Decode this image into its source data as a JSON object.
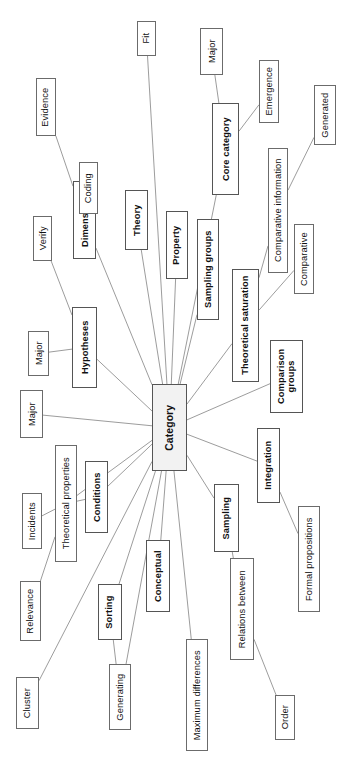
{
  "figure": {
    "type": "mind-map",
    "orientation_note": "figure printed sideways; all labels rotated 90 degrees",
    "center_label": "Category",
    "colors": {
      "page_background": "#ffffff",
      "box_fill": "#ffffff",
      "center_box_fill": "#f2f2f2",
      "box_stroke": "#6b6b6b",
      "edge_stroke": "#8a8a8a",
      "text": "#111111"
    }
  },
  "center": {
    "id": "category",
    "label": "Category",
    "bold": true,
    "x": 152,
    "y": 384,
    "w": 35,
    "h": 87
  },
  "nodes": [
    {
      "id": "dimensions",
      "label": "Dimensions",
      "level": 1,
      "x": 73,
      "y": 181,
      "w": 23,
      "h": 78,
      "lines": 1
    },
    {
      "id": "theory",
      "label": "Theory",
      "level": 1,
      "x": 125,
      "y": 190,
      "w": 23,
      "h": 60,
      "lines": 1
    },
    {
      "id": "property",
      "label": "Property",
      "level": 1,
      "x": 166,
      "y": 211,
      "w": 22,
      "h": 68,
      "lines": 1
    },
    {
      "id": "sampling-groups",
      "label": "Sampling groups",
      "level": 1,
      "x": 197,
      "y": 219,
      "w": 22,
      "h": 101,
      "lines": 1
    },
    {
      "id": "core-category",
      "label": "Core category",
      "level": 1,
      "x": 212,
      "y": 103,
      "w": 27,
      "h": 92,
      "lines": 1
    },
    {
      "id": "theoretical-saturation",
      "label": "Theoretical saturation",
      "level": 1,
      "x": 232,
      "y": 269,
      "w": 27,
      "h": 113,
      "lines": 1
    },
    {
      "id": "comparison-groups",
      "label": "Comparison groups",
      "level": 1,
      "x": 270,
      "y": 340,
      "w": 33,
      "h": 73,
      "lines": 2
    },
    {
      "id": "hypotheses",
      "label": "Hypotheses",
      "level": 1,
      "x": 72,
      "y": 307,
      "w": 25,
      "h": 81,
      "lines": 1
    },
    {
      "id": "conditions",
      "label": "Conditions",
      "level": 1,
      "x": 85,
      "y": 461,
      "w": 23,
      "h": 72,
      "lines": 1
    },
    {
      "id": "integration",
      "label": "Integration",
      "level": 1,
      "x": 257,
      "y": 428,
      "w": 23,
      "h": 75,
      "lines": 1
    },
    {
      "id": "sampling",
      "label": "Sampling",
      "level": 1,
      "x": 214,
      "y": 484,
      "w": 25,
      "h": 68,
      "lines": 1
    },
    {
      "id": "conceptual",
      "label": "Conceptual",
      "level": 1,
      "x": 146,
      "y": 540,
      "w": 24,
      "h": 72,
      "lines": 1
    },
    {
      "id": "sorting",
      "label": "Sorting",
      "level": 1,
      "x": 98,
      "y": 584,
      "w": 24,
      "h": 56,
      "lines": 1
    },
    {
      "id": "evidence",
      "label": "Evidence",
      "level": 2,
      "x": 36,
      "y": 78,
      "w": 20,
      "h": 58,
      "lines": 1
    },
    {
      "id": "coding",
      "label": "Coding",
      "level": 2,
      "x": 79,
      "y": 162,
      "w": 19,
      "h": 52,
      "lines": 1
    },
    {
      "id": "fit",
      "label": "Fit",
      "level": 2,
      "x": 137,
      "y": 21,
      "w": 19,
      "h": 35,
      "lines": 1
    },
    {
      "id": "major-core",
      "label": "Major",
      "level": 2,
      "x": 200,
      "y": 28,
      "w": 23,
      "h": 47,
      "lines": 1
    },
    {
      "id": "emergence",
      "label": "Emergence",
      "level": 2,
      "x": 259,
      "y": 60,
      "w": 20,
      "h": 63,
      "lines": 1
    },
    {
      "id": "generated",
      "label": "Generated",
      "level": 2,
      "x": 314,
      "y": 85,
      "w": 22,
      "h": 60,
      "lines": 1
    },
    {
      "id": "comparative-information",
      "label": "Comparative information",
      "level": 2,
      "x": 268,
      "y": 148,
      "w": 20,
      "h": 125,
      "lines": 1
    },
    {
      "id": "comparative",
      "label": "Comparative",
      "level": 2,
      "x": 294,
      "y": 224,
      "w": 20,
      "h": 70,
      "lines": 1
    },
    {
      "id": "verify",
      "label": "Verify",
      "level": 2,
      "x": 33,
      "y": 216,
      "w": 19,
      "h": 45,
      "lines": 1
    },
    {
      "id": "major-hypotheses",
      "label": "Major",
      "level": 2,
      "x": 28,
      "y": 331,
      "w": 21,
      "h": 45,
      "lines": 1
    },
    {
      "id": "major-category",
      "label": "Major",
      "level": 2,
      "x": 20,
      "y": 390,
      "w": 23,
      "h": 48,
      "lines": 1
    },
    {
      "id": "theoretical-properties",
      "label": "Theoretical properties",
      "level": 2,
      "x": 55,
      "y": 445,
      "w": 22,
      "h": 117,
      "lines": 1
    },
    {
      "id": "incidents",
      "label": "Incidents",
      "level": 2,
      "x": 22,
      "y": 493,
      "w": 20,
      "h": 56,
      "lines": 1
    },
    {
      "id": "relevance",
      "label": "Relevance",
      "level": 2,
      "x": 20,
      "y": 581,
      "w": 21,
      "h": 60,
      "lines": 1
    },
    {
      "id": "cluster",
      "label": "Cluster",
      "level": 2,
      "x": 16,
      "y": 677,
      "w": 23,
      "h": 52,
      "lines": 1
    },
    {
      "id": "generating",
      "label": "Generating",
      "level": 2,
      "x": 109,
      "y": 664,
      "w": 22,
      "h": 66,
      "lines": 1
    },
    {
      "id": "maximum-differences",
      "label": "Maximum differences",
      "level": 2,
      "x": 186,
      "y": 639,
      "w": 22,
      "h": 112,
      "lines": 1
    },
    {
      "id": "relations-between",
      "label": "Relations between",
      "level": 2,
      "x": 230,
      "y": 558,
      "w": 24,
      "h": 102,
      "lines": 1
    },
    {
      "id": "order",
      "label": "Order",
      "level": 2,
      "x": 275,
      "y": 695,
      "w": 20,
      "h": 45,
      "lines": 1
    },
    {
      "id": "formal-propositions",
      "label": "Formal propositions",
      "level": 2,
      "x": 298,
      "y": 506,
      "w": 22,
      "h": 106,
      "lines": 1
    }
  ],
  "edges": [
    {
      "from": "category",
      "to": "dimensions"
    },
    {
      "from": "category",
      "to": "theory"
    },
    {
      "from": "category",
      "to": "property"
    },
    {
      "from": "category",
      "to": "sampling-groups"
    },
    {
      "from": "category",
      "to": "core-category"
    },
    {
      "from": "category",
      "to": "theoretical-saturation"
    },
    {
      "from": "category",
      "to": "comparison-groups"
    },
    {
      "from": "category",
      "to": "hypotheses"
    },
    {
      "from": "category",
      "to": "conditions"
    },
    {
      "from": "category",
      "to": "integration"
    },
    {
      "from": "category",
      "to": "sampling"
    },
    {
      "from": "category",
      "to": "conceptual"
    },
    {
      "from": "category",
      "to": "sorting"
    },
    {
      "from": "category",
      "to": "fit"
    },
    {
      "from": "category",
      "to": "major-category"
    },
    {
      "from": "category",
      "to": "theoretical-properties"
    },
    {
      "from": "category",
      "to": "cluster"
    },
    {
      "from": "category",
      "to": "generating"
    },
    {
      "from": "category",
      "to": "maximum-differences"
    },
    {
      "from": "dimensions",
      "to": "evidence"
    },
    {
      "from": "dimensions",
      "to": "coding"
    },
    {
      "from": "hypotheses",
      "to": "verify"
    },
    {
      "from": "hypotheses",
      "to": "major-hypotheses"
    },
    {
      "from": "core-category",
      "to": "major-core"
    },
    {
      "from": "core-category",
      "to": "emergence"
    },
    {
      "from": "theoretical-saturation",
      "to": "comparative-information"
    },
    {
      "from": "theoretical-saturation",
      "to": "comparative"
    },
    {
      "from": "comparative-information",
      "to": "generated"
    },
    {
      "from": "theoretical-properties",
      "to": "incidents"
    },
    {
      "from": "theoretical-properties",
      "to": "relevance"
    },
    {
      "from": "sorting",
      "to": "generating"
    },
    {
      "from": "integration",
      "to": "formal-propositions"
    },
    {
      "from": "sampling",
      "to": "relations-between"
    },
    {
      "from": "relations-between",
      "to": "order"
    },
    {
      "from": "conditions",
      "to": "theoretical-properties"
    }
  ]
}
